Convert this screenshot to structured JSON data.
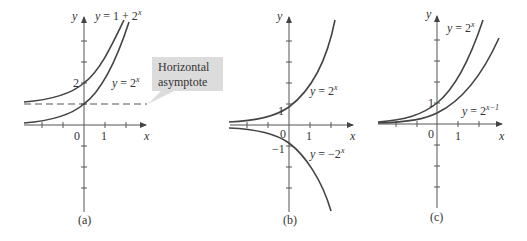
{
  "figure": {
    "panels": [
      {
        "id": "a",
        "caption": "(a)",
        "x_axis_label": "x",
        "y_axis_label": "y",
        "tick_labels": {
          "origin": "0",
          "x1": "1",
          "y2": "2"
        },
        "curves": [
          {
            "label": "y = 1 + 2",
            "exponent": "x",
            "function": "1 + 2^x"
          },
          {
            "label": "y = 2",
            "exponent": "x",
            "function": "2^x"
          }
        ],
        "asymptote": {
          "y": 1,
          "style": "dashed"
        },
        "callout": {
          "line1": "Horizontal",
          "line2": "asymptote"
        }
      },
      {
        "id": "b",
        "caption": "(b)",
        "x_axis_label": "x",
        "y_axis_label": "y",
        "tick_labels": {
          "origin": "0",
          "x1": "1",
          "y1": "1",
          "yneg1": "−1"
        },
        "curves": [
          {
            "label": "y = 2",
            "exponent": "x",
            "function": "2^x"
          },
          {
            "label": "y = −2",
            "exponent": "x",
            "function": "-2^x"
          }
        ]
      },
      {
        "id": "c",
        "caption": "(c)",
        "x_axis_label": "x",
        "y_axis_label": "y",
        "tick_labels": {
          "origin": "0",
          "x1": "1",
          "y1": "1"
        },
        "curves": [
          {
            "label": "y = 2",
            "exponent": "x",
            "function": "2^x"
          },
          {
            "label": "y = 2",
            "exponent": "x−1",
            "function": "2^(x-1)"
          }
        ]
      }
    ],
    "colors": {
      "curve": "#444444",
      "axis": "#555555",
      "callout_bg": "#dcdcdc",
      "text": "#333333"
    }
  }
}
